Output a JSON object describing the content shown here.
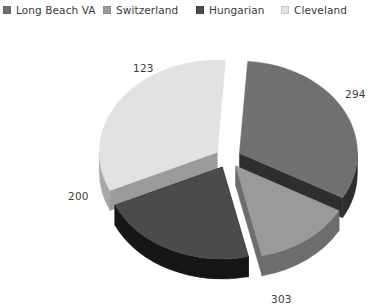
{
  "legend": {
    "items": [
      {
        "label": "Long Beach VA",
        "color": "#707070",
        "x": 3
      },
      {
        "label": "Switzerland",
        "color": "#9a9a9a",
        "x": 103
      },
      {
        "label": "Hungarian",
        "color": "#4b4b4b",
        "x": 196
      },
      {
        "label": "Cleveland",
        "color": "#e2e2e2",
        "x": 281
      }
    ]
  },
  "labels": {
    "v123": "123",
    "v294": "294",
    "v200": "200",
    "v303": "303"
  },
  "chart_data": {
    "type": "pie",
    "title": "",
    "exploded": true,
    "three_d": true,
    "legend_position": "top",
    "total": 920,
    "categories": [
      "Long Beach VA",
      "Switzerland",
      "Hungarian",
      "Cleveland"
    ],
    "values": [
      294,
      123,
      200,
      303
    ],
    "data_labels": [
      "294",
      "123",
      "200",
      "303"
    ],
    "colors": [
      "#707070",
      "#9a9a9a",
      "#4b4b4b",
      "#e2e2e2"
    ],
    "side_colors": [
      "#2e2e2e",
      "#6d6d6d",
      "#161616",
      "#a8a8a8"
    ],
    "percentages": [
      31.96,
      13.37,
      21.74,
      32.93
    ],
    "slices": [
      {
        "name": "Long Beach VA",
        "value": 294,
        "label": "294",
        "percent": 31.96,
        "color": "#707070"
      },
      {
        "name": "Switzerland",
        "value": 123,
        "label": "123",
        "percent": 13.37,
        "color": "#9a9a9a"
      },
      {
        "name": "Hungarian",
        "value": 200,
        "label": "200",
        "percent": 21.74,
        "color": "#4b4b4b"
      },
      {
        "name": "Cleveland",
        "value": 303,
        "label": "303",
        "percent": 32.93,
        "color": "#e2e2e2"
      }
    ]
  }
}
